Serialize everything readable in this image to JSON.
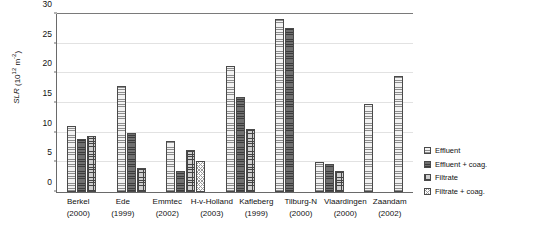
{
  "chart_data": {
    "type": "bar",
    "title": "",
    "xlabel": "",
    "ylabel": "SLR",
    "ylabel_unit": "(10^12 m^-2)",
    "ylim": [
      0,
      30
    ],
    "yticks": [
      0,
      5,
      10,
      15,
      20,
      25,
      30
    ],
    "grid": true,
    "legend_position": "right",
    "categories": [
      "Berkel",
      "Ede",
      "Emmtec",
      "H-v-Holland",
      "Kafleberg",
      "Tilburg-N",
      "Vlaardingen",
      "Zaandam"
    ],
    "category_years": [
      "(2000)",
      "(1999)",
      "(2002)",
      "(2003)",
      "(1999)",
      "(2000)",
      "(2000)",
      "(2002)"
    ],
    "series": [
      {
        "name": "Effluent",
        "key": "effluent",
        "values": [
          11.1,
          17.8,
          8.6,
          21.3,
          29.2,
          5.0,
          14.8,
          19.5
        ]
      },
      {
        "name": "Effluent + coag.",
        "key": "effluent-coag",
        "values": [
          8.9,
          10.0,
          3.5,
          16.0,
          27.7,
          4.8,
          null,
          null
        ]
      },
      {
        "name": "Filtrate",
        "key": "filtrate",
        "values": [
          9.5,
          4.0,
          7.0,
          10.6,
          null,
          3.5,
          null,
          null
        ]
      },
      {
        "name": "Filtrate + coag.",
        "key": "filtrate-coag",
        "values": [
          null,
          null,
          5.2,
          null,
          null,
          null,
          null,
          null
        ]
      }
    ]
  },
  "legend": {
    "items": [
      {
        "label": "Effluent",
        "pattern": "p-effluent"
      },
      {
        "label": "Effluent + coag.",
        "pattern": "p-effluent-coag"
      },
      {
        "label": "Filtrate",
        "pattern": "p-filtrate"
      },
      {
        "label": "Filtrate + coag.",
        "pattern": "p-filtrate-coag"
      }
    ]
  }
}
